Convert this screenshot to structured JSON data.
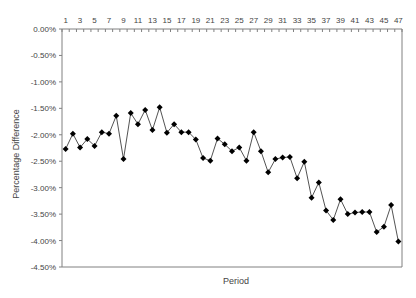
{
  "chart_data": {
    "type": "line",
    "title": "",
    "xlabel": "Period",
    "ylabel": "Percentage Difference",
    "x_axis_position": "top",
    "x_tick_labels": [
      "1",
      "3",
      "5",
      "7",
      "9",
      "11",
      "13",
      "15",
      "17",
      "19",
      "21",
      "23",
      "25",
      "27",
      "29",
      "31",
      "33",
      "35",
      "37",
      "39",
      "41",
      "43",
      "45",
      "47"
    ],
    "y_tick_labels": [
      "0.00%",
      "-0.50%",
      "-1.00%",
      "-1.50%",
      "-2.00%",
      "-2.50%",
      "-3.00%",
      "-3.50%",
      "-4.00%",
      "-4.50%"
    ],
    "ylim": [
      -4.5,
      0.0
    ],
    "grid": false,
    "legend": null,
    "marker": "diamond",
    "series": [
      {
        "name": "Percentage Difference",
        "color": "#000000",
        "x": [
          1,
          2,
          3,
          4,
          5,
          6,
          7,
          8,
          9,
          10,
          11,
          12,
          13,
          14,
          15,
          16,
          17,
          18,
          19,
          20,
          21,
          22,
          23,
          24,
          25,
          26,
          27,
          28,
          29,
          30,
          31,
          32,
          33,
          34,
          35,
          36,
          37,
          38,
          39,
          40,
          41,
          42,
          43,
          44,
          45,
          46,
          47
        ],
        "values": [
          -2.27,
          -1.98,
          -2.24,
          -2.08,
          -2.21,
          -1.95,
          -1.98,
          -1.64,
          -2.46,
          -1.59,
          -1.8,
          -1.53,
          -1.91,
          -1.48,
          -1.96,
          -1.8,
          -1.95,
          -1.95,
          -2.09,
          -2.44,
          -2.49,
          -2.07,
          -2.18,
          -2.31,
          -2.24,
          -2.49,
          -1.95,
          -2.31,
          -2.71,
          -2.46,
          -2.43,
          -2.42,
          -2.82,
          -2.51,
          -3.19,
          -2.9,
          -3.43,
          -3.61,
          -3.22,
          -3.5,
          -3.47,
          -3.46,
          -3.46,
          -3.84,
          -3.74,
          -3.33,
          -4.02
        ]
      }
    ]
  },
  "colors": {
    "axis": "#808080",
    "line": "#404040",
    "marker": "#000000",
    "text": "#444444"
  }
}
